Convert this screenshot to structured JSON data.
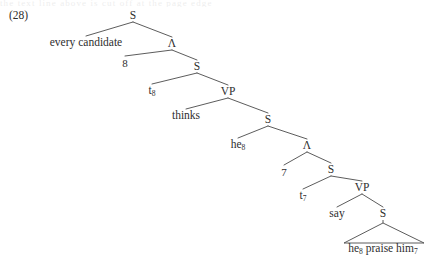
{
  "figure": {
    "example_number": "(28)",
    "scan_remnant_text": "the text line above is cut off at the page edge",
    "background_color": "#ffffff",
    "ink_color": "#2e2e2e"
  },
  "tree": {
    "nodes": [
      {
        "id": "s-root",
        "label": "S",
        "kind": "nonterminal",
        "x": 133,
        "y": 16
      },
      {
        "id": "np-subject",
        "label": "every candidate",
        "kind": "terminal",
        "x": 86,
        "y": 43
      },
      {
        "id": "lambda-8",
        "label": "Λ",
        "kind": "nonterminal",
        "x": 172,
        "y": 44
      },
      {
        "id": "index-8",
        "label": "8",
        "kind": "index",
        "x": 125,
        "y": 63
      },
      {
        "id": "s-1",
        "label": "S",
        "kind": "nonterminal",
        "x": 197,
        "y": 67
      },
      {
        "id": "trace-8",
        "label": "t8",
        "kind": "terminal",
        "x": 152,
        "y": 91
      },
      {
        "id": "vp-1",
        "label": "VP",
        "kind": "nonterminal",
        "x": 228,
        "y": 92
      },
      {
        "id": "verb-thinks",
        "label": "thinks",
        "kind": "terminal",
        "x": 186,
        "y": 116
      },
      {
        "id": "s-2",
        "label": "S",
        "kind": "nonterminal",
        "x": 268,
        "y": 120
      },
      {
        "id": "pron-he8",
        "label": "he8",
        "kind": "terminal",
        "x": 238,
        "y": 145
      },
      {
        "id": "lambda-7",
        "label": "Λ",
        "kind": "nonterminal",
        "x": 307,
        "y": 146
      },
      {
        "id": "index-7",
        "label": "7",
        "kind": "index",
        "x": 284,
        "y": 172
      },
      {
        "id": "s-3",
        "label": "S",
        "kind": "nonterminal",
        "x": 331,
        "y": 170
      },
      {
        "id": "trace-7",
        "label": "t7",
        "kind": "terminal",
        "x": 303,
        "y": 196
      },
      {
        "id": "vp-2",
        "label": "VP",
        "kind": "nonterminal",
        "x": 362,
        "y": 188
      },
      {
        "id": "verb-say",
        "label": "say",
        "kind": "terminal",
        "x": 337,
        "y": 214
      },
      {
        "id": "s-4",
        "label": "S",
        "kind": "nonterminal",
        "x": 383,
        "y": 214
      },
      {
        "id": "clause-bottom",
        "label": "he8 praise him7",
        "kind": "terminal",
        "x": 383,
        "y": 249
      }
    ],
    "node_text": {
      "s-root": "S",
      "np-subject": "every candidate",
      "lambda-8": "Λ",
      "index-8": "8",
      "s-1": "S",
      "vp-1": "VP",
      "verb-thinks": "thinks",
      "s-2": "S",
      "lambda-7": "Λ",
      "index-7": "7",
      "s-3": "S",
      "vp-2": "VP",
      "verb-say": "say",
      "s-4": "S"
    },
    "subscripted_text": {
      "trace-8": {
        "base": "t",
        "sub": "8"
      },
      "pron-he8": {
        "base": "he",
        "sub": "8"
      },
      "trace-7": {
        "base": "t",
        "sub": "7"
      },
      "verb-say-none": {
        "base": "",
        "sub": ""
      }
    },
    "bottom_clause": {
      "word1_base": "he",
      "word1_sub": "8",
      "word2": "praise",
      "word3_base": "him",
      "word3_sub": "7"
    },
    "edges": [
      {
        "from": "s-root",
        "to": "np-subject"
      },
      {
        "from": "s-root",
        "to": "lambda-8"
      },
      {
        "from": "lambda-8",
        "to": "index-8"
      },
      {
        "from": "lambda-8",
        "to": "s-1"
      },
      {
        "from": "s-1",
        "to": "trace-8"
      },
      {
        "from": "s-1",
        "to": "vp-1"
      },
      {
        "from": "vp-1",
        "to": "verb-thinks"
      },
      {
        "from": "vp-1",
        "to": "s-2"
      },
      {
        "from": "s-2",
        "to": "pron-he8"
      },
      {
        "from": "s-2",
        "to": "lambda-7"
      },
      {
        "from": "lambda-7",
        "to": "index-7"
      },
      {
        "from": "lambda-7",
        "to": "s-3"
      },
      {
        "from": "s-3",
        "to": "trace-7"
      },
      {
        "from": "s-3",
        "to": "vp-2"
      },
      {
        "from": "vp-2",
        "to": "verb-say"
      },
      {
        "from": "vp-2",
        "to": "s-4"
      }
    ],
    "triangle": {
      "apex_x": 383,
      "apex_y": 223,
      "left_x": 344,
      "right_x": 424,
      "base_y": 243
    }
  }
}
